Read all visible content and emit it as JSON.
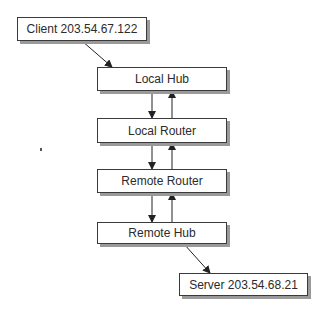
{
  "diagram": {
    "type": "network-path",
    "nodes": [
      {
        "id": "client",
        "label": "Client 203.54.67.122"
      },
      {
        "id": "local_hub",
        "label": "Local Hub"
      },
      {
        "id": "local_router",
        "label": "Local Router"
      },
      {
        "id": "remote_router",
        "label": "Remote Router"
      },
      {
        "id": "remote_hub",
        "label": "Remote Hub"
      },
      {
        "id": "server",
        "label": "Server 203.54.68.21"
      }
    ],
    "edges": [
      {
        "from": "client",
        "to": "local_hub",
        "direction": "one-way"
      },
      {
        "from": "local_hub",
        "to": "local_router",
        "direction": "bidirectional"
      },
      {
        "from": "local_router",
        "to": "remote_router",
        "direction": "bidirectional"
      },
      {
        "from": "remote_router",
        "to": "remote_hub",
        "direction": "bidirectional"
      },
      {
        "from": "remote_hub",
        "to": "server",
        "direction": "one-way"
      }
    ]
  },
  "colors": {
    "border": "#3a3a3a",
    "shadow": "#9a9a9a",
    "text": "#2b2b2b",
    "arrow": "#222222"
  }
}
